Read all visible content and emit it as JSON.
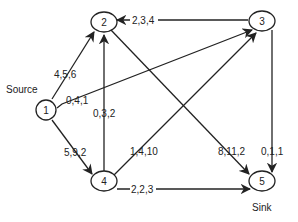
{
  "diagram": {
    "title": "",
    "nodes": [
      {
        "id": "1",
        "label": "1",
        "annotation": "Source"
      },
      {
        "id": "2",
        "label": "2"
      },
      {
        "id": "3",
        "label": "3"
      },
      {
        "id": "4",
        "label": "4"
      },
      {
        "id": "5",
        "label": "5",
        "annotation": "Sink"
      }
    ],
    "edges": [
      {
        "from": "1",
        "to": "2",
        "label": "4,5,6"
      },
      {
        "from": "1",
        "to": "3",
        "label": "0,4,1"
      },
      {
        "from": "1",
        "to": "4",
        "label": "5,9,2"
      },
      {
        "from": "3",
        "to": "2",
        "label": "2,3,4"
      },
      {
        "from": "4",
        "to": "2",
        "label": "0,3,2"
      },
      {
        "from": "2",
        "to": "5",
        "label": "8,11,2"
      },
      {
        "from": "4",
        "to": "3",
        "label": "1,4,10"
      },
      {
        "from": "4",
        "to": "5",
        "label": "2,2,3"
      },
      {
        "from": "3",
        "to": "5",
        "label": "0,1,1"
      }
    ],
    "source_label": "Source",
    "sink_label": "Sink"
  }
}
